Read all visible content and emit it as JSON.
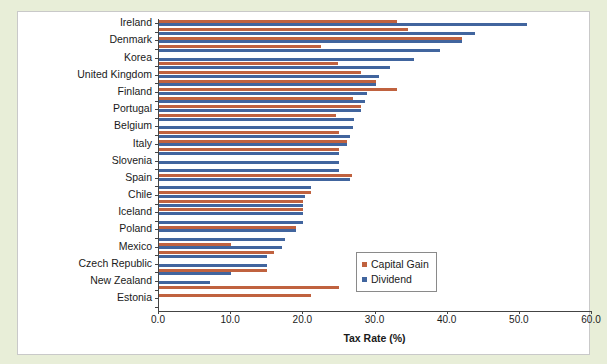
{
  "page": {
    "background_color": "#e8eed8",
    "panel_background": "#ffffff"
  },
  "chart_data": {
    "type": "bar",
    "orientation": "horizontal",
    "title": "",
    "xlabel": "Tax Rate (%)",
    "ylabel": "",
    "xlim": [
      0.0,
      60.0
    ],
    "xticks": [
      "0.0",
      "10.0",
      "20.0",
      "30.0",
      "40.0",
      "50.0",
      "60.0"
    ],
    "xtick_values": [
      0,
      10,
      20,
      30,
      40,
      50,
      60
    ],
    "grid": false,
    "legend_position": "center-right",
    "colors": {
      "capital_gain": "#c0623f",
      "dividend": "#41659e"
    },
    "series": [
      {
        "name": "Capital Gain",
        "color": "#c0623f"
      },
      {
        "name": "Dividend",
        "color": "#41659e"
      }
    ],
    "categories": [
      "Ireland",
      "",
      "Denmark",
      "",
      "Korea",
      "",
      "United Kingdom",
      "",
      "Finland",
      "",
      "Portugal",
      "",
      "Belgium",
      "",
      "Italy",
      "",
      "Slovenia",
      "",
      "Spain",
      "",
      "Chile",
      "",
      "Iceland",
      "",
      "Poland",
      "",
      "Mexico",
      "",
      "Czech Republic",
      "",
      "New Zealand",
      "",
      "Estonia",
      ""
    ],
    "visible_labels": [
      "Ireland",
      "Denmark",
      "Korea",
      "United Kingdom",
      "Finland",
      "Portugal",
      "Belgium",
      "Italy",
      "Slovenia",
      "Spain",
      "Chile",
      "Iceland",
      "Poland",
      "Mexico",
      "Czech Republic",
      "New Zealand",
      "Estonia"
    ],
    "rows": [
      {
        "label": "Ireland",
        "capital_gain": 33.0,
        "dividend": 51.0
      },
      {
        "label": "",
        "capital_gain": 34.5,
        "dividend": 43.8
      },
      {
        "label": "Denmark",
        "capital_gain": 42.0,
        "dividend": 42.0
      },
      {
        "label": "",
        "capital_gain": 22.5,
        "dividend": 39.0
      },
      {
        "label": "Korea",
        "capital_gain": 0.0,
        "dividend": 35.4
      },
      {
        "label": "",
        "capital_gain": 24.8,
        "dividend": 32.0
      },
      {
        "label": "United Kingdom",
        "capital_gain": 28.0,
        "dividend": 30.5
      },
      {
        "label": "",
        "capital_gain": 30.0,
        "dividend": 30.0
      },
      {
        "label": "Finland",
        "capital_gain": 33.0,
        "dividend": 28.8
      },
      {
        "label": "",
        "capital_gain": 26.9,
        "dividend": 28.5
      },
      {
        "label": "Portugal",
        "capital_gain": 28.0,
        "dividend": 28.0
      },
      {
        "label": "",
        "capital_gain": 24.5,
        "dividend": 27.0
      },
      {
        "label": "Belgium",
        "capital_gain": 0.0,
        "dividend": 26.9
      },
      {
        "label": "",
        "capital_gain": 25.0,
        "dividend": 26.4
      },
      {
        "label": "Italy",
        "capital_gain": 26.0,
        "dividend": 26.0
      },
      {
        "label": "",
        "capital_gain": 25.0,
        "dividend": 25.0
      },
      {
        "label": "Slovenia",
        "capital_gain": 0.0,
        "dividend": 25.0
      },
      {
        "label": "",
        "capital_gain": 0.0,
        "dividend": 25.0
      },
      {
        "label": "Spain",
        "capital_gain": 26.8,
        "dividend": 26.4
      },
      {
        "label": "",
        "capital_gain": 0.0,
        "dividend": 21.0
      },
      {
        "label": "Chile",
        "capital_gain": 21.0,
        "dividend": 20.3
      },
      {
        "label": "",
        "capital_gain": 20.0,
        "dividend": 20.0
      },
      {
        "label": "Iceland",
        "capital_gain": 20.0,
        "dividend": 20.0
      },
      {
        "label": "",
        "capital_gain": 0.0,
        "dividend": 20.0
      },
      {
        "label": "Poland",
        "capital_gain": 19.0,
        "dividend": 19.0
      },
      {
        "label": "",
        "capital_gain": 0.0,
        "dividend": 17.5
      },
      {
        "label": "Mexico",
        "capital_gain": 10.0,
        "dividend": 17.0
      },
      {
        "label": "",
        "capital_gain": 16.0,
        "dividend": 15.0
      },
      {
        "label": "Czech Republic",
        "capital_gain": 0.0,
        "dividend": 15.0
      },
      {
        "label": "",
        "capital_gain": 15.0,
        "dividend": 10.0
      },
      {
        "label": "New Zealand",
        "capital_gain": 0.0,
        "dividend": 7.0
      },
      {
        "label": "",
        "capital_gain": 25.0,
        "dividend": 0.0
      },
      {
        "label": "Estonia",
        "capital_gain": 21.0,
        "dividend": 0.0
      },
      {
        "label": "",
        "capital_gain": 0.0,
        "dividend": 0.0
      }
    ]
  },
  "legend": {
    "items": [
      {
        "label": "Capital Gain",
        "color": "#c0623f"
      },
      {
        "label": "Dividend",
        "color": "#41659e"
      }
    ]
  },
  "axis": {
    "x_title": "Tax Rate (%)"
  }
}
